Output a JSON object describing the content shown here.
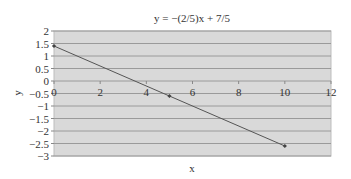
{
  "chart_data": {
    "type": "line",
    "title": "y = −(2/5)x + 7/5",
    "xlabel": "x",
    "ylabel": "y",
    "xlim": [
      0,
      12
    ],
    "ylim": [
      -3,
      2
    ],
    "x_ticks": [
      0,
      2,
      4,
      6,
      8,
      10,
      12
    ],
    "y_ticks": [
      2,
      1.5,
      1,
      0.5,
      0,
      -0.5,
      -1,
      -1.5,
      -2,
      -2.5,
      -3
    ],
    "y_tick_labels": [
      "2",
      "1.5",
      "1",
      "0.5",
      "0",
      "−0.5",
      "−1",
      "−1.5",
      "−2",
      "−2.5",
      "−3"
    ],
    "grid": true,
    "legend": null,
    "series": [
      {
        "name": "y = −(2/5)x + 7/5",
        "x": [
          0,
          5,
          10
        ],
        "y": [
          1.4,
          -0.6,
          -2.6
        ]
      }
    ]
  },
  "colors": {
    "plot_background": "#d9d9d9",
    "gridline": "#9a9a9a",
    "line": "#555555",
    "marker": "#444444"
  }
}
